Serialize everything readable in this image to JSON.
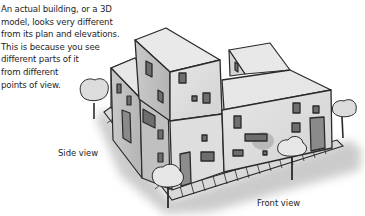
{
  "caption": {
    "lines": [
      "An actual building, or a 3D",
      "model, looks very different",
      "from its plan and elevations.",
      "This is because you see",
      "different parts of it",
      "from different",
      "points of view."
    ]
  },
  "labels": {
    "side_view": "Side view",
    "front_view": "Front view"
  },
  "illustration": {
    "subject": "3D building with trees and sidewalk",
    "colors": {
      "wall_light": "#e4e4e4",
      "wall_mid": "#cfcfcf",
      "wall_dark": "#b8b8b8",
      "roof": "#e9e9e9",
      "window": "#6e6e6e",
      "outline": "#2a2a2a",
      "shadow": "#c8c8c8",
      "tree": "#e0e0e0"
    }
  }
}
